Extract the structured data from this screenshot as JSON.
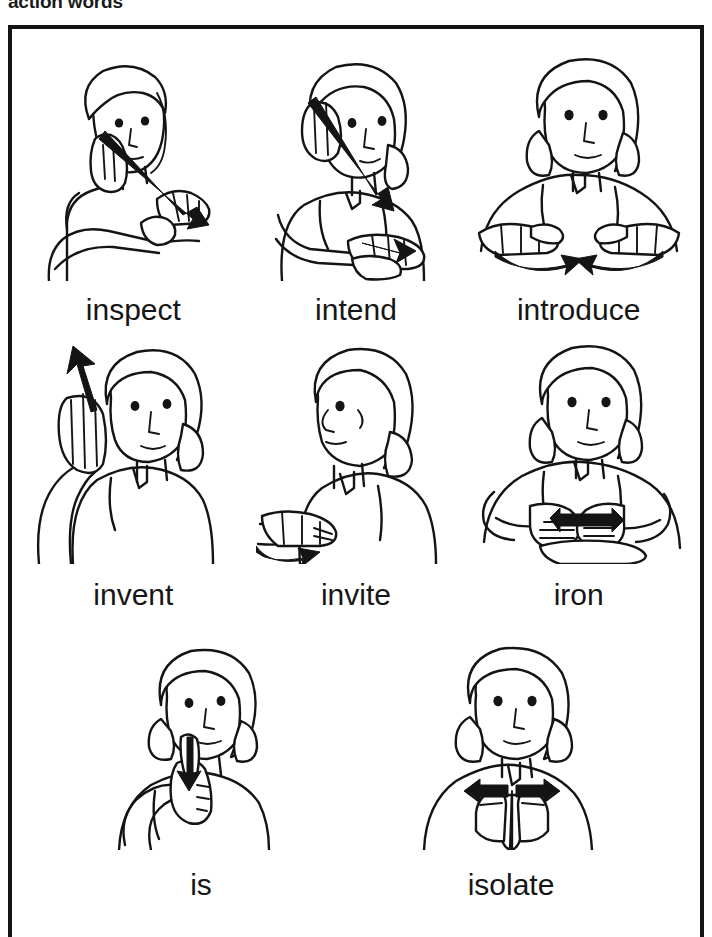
{
  "page": {
    "header_title": "action words",
    "frame_color": "#141414",
    "background_color": "#ffffff",
    "ink_color": "#141414"
  },
  "rows": [
    {
      "index": 1,
      "cells": [
        {
          "label": "inspect",
          "icon": "asl-sign-inspect",
          "description": "hand at eye, thick straight arrow down-right to open palm"
        },
        {
          "label": "intend",
          "icon": "asl-sign-intend",
          "description": "hand at forehead, thick straight arrow down to flat open palm"
        },
        {
          "label": "introduce",
          "icon": "asl-sign-introduce",
          "description": "both open palms up, curved arrows sweeping toward each other"
        }
      ]
    },
    {
      "index": 2,
      "cells": [
        {
          "label": "invent",
          "icon": "asl-sign-invent",
          "description": "flat hand at forehead, straight arrow pointing up and out"
        },
        {
          "label": "invite",
          "icon": "asl-sign-invite",
          "description": "profile view, open palm with curved arrow sweeping inward to body"
        },
        {
          "label": "iron",
          "icon": "asl-sign-iron",
          "description": "fist sliding over flat hand, double-headed horizontal arrow"
        }
      ]
    },
    {
      "index": 3,
      "cells": [
        {
          "label": "is",
          "icon": "asl-sign-is",
          "description": "index finger at chin, short arrow pointing down"
        },
        {
          "label": "isolate",
          "icon": "asl-sign-isolate",
          "description": "two index fingers together at chest, arrows pointing apart"
        }
      ]
    }
  ]
}
